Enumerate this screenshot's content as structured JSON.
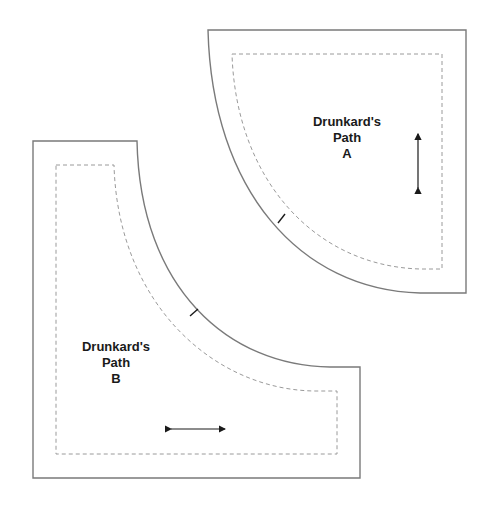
{
  "diagram": {
    "type": "quilt-template",
    "colors": {
      "cut_line": "#7a7a7a",
      "seam_line": "#9a9a9a",
      "ink": "#1a1a1a",
      "background": "#ffffff"
    },
    "pieces": [
      {
        "id": "A",
        "label_line1": "Drunkard's",
        "label_line2": "Path",
        "label_line3": "A",
        "grain_arrow": "vertical",
        "notch": true
      },
      {
        "id": "B",
        "label_line1": "Drunkard's",
        "label_line2": "Path",
        "label_line3": "B",
        "grain_arrow": "horizontal",
        "notch": true
      }
    ]
  }
}
